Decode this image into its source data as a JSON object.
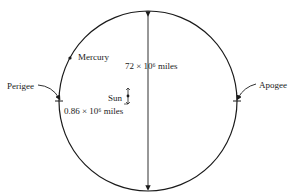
{
  "diagram": {
    "type": "orbit-ellipse",
    "labels": {
      "mercury": "Mercury",
      "perigee": "Perigee",
      "apogee": "Apogee",
      "sun": "Sun",
      "minor_axis": "72 × 10⁶ miles",
      "sun_offset": "0.86 × 10⁶ miles"
    },
    "colors": {
      "line": "#1a1a1a",
      "background": "#ffffff"
    }
  }
}
